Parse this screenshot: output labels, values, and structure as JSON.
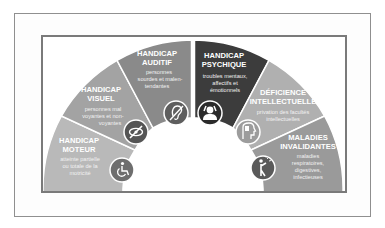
{
  "colors": {
    "outer_border": "#8f8f8f",
    "inner_border": "#7a7a7a",
    "segments": [
      "#b9b9b9",
      "#a3a3a3",
      "#8a8a8a",
      "#3c3c3c",
      "#b0b0b0",
      "#9a9a9a"
    ],
    "icon_bg": [
      "#6e6e6e",
      "#555555",
      "#5e5e5e",
      "#2b2b2b",
      "#9c9c9c",
      "#5a5a5a"
    ]
  },
  "segments": [
    {
      "title_line1": "HANDICAP",
      "title_line2": "MOTEUR",
      "desc_line1": "atteinte partielle",
      "desc_line2": "ou totale de la",
      "desc_line3": "motricité",
      "icon": "wheelchair-icon"
    },
    {
      "title_line1": "HANDICAP",
      "title_line2": "VISUEL",
      "desc_line1": "personnes mal",
      "desc_line2": "voyantes et non-",
      "desc_line3": "voyantes",
      "icon": "eye-crossed-icon"
    },
    {
      "title_line1": "HANDICAP",
      "title_line2": "AUDITIF",
      "desc_line1": "personnes",
      "desc_line2": "sourdes et malen-",
      "desc_line3": "tendantes",
      "icon": "ear-crossed-icon"
    },
    {
      "title_line1": "HANDICAP",
      "title_line2": "PSYCHIQUE",
      "desc_line1": "troubles mentaux,",
      "desc_line2": "affectifs et",
      "desc_line3": "émotionnels",
      "icon": "head-hands-icon"
    },
    {
      "title_line1": "DÉFICIENCE",
      "title_line2": "INTELLECTUELLE",
      "desc_line1": "privation des facultés",
      "desc_line2": "intellectuelles",
      "desc_line3": "",
      "icon": "head-profile-icon"
    },
    {
      "title_line1": "MALADIES",
      "title_line2": "INVALIDANTES",
      "desc_line1": "maladies",
      "desc_line2": "respiratoires,",
      "desc_line3": "digestives,",
      "desc_line4": "infectieuses",
      "icon": "person-pain-icon"
    }
  ]
}
